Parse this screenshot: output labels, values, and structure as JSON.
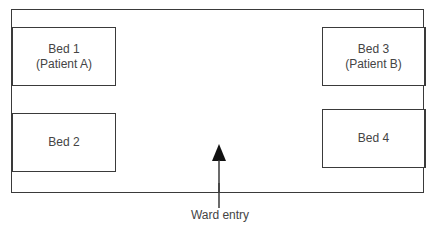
{
  "diagram": {
    "type": "floor-plan",
    "ward": {
      "beds": [
        {
          "id": "bed-1",
          "name": "Bed 1",
          "occupant": "(Patient A)",
          "position": "top-left"
        },
        {
          "id": "bed-2",
          "name": "Bed 2",
          "occupant": "",
          "position": "bottom-left"
        },
        {
          "id": "bed-3",
          "name": "Bed 3",
          "occupant": "(Patient B)",
          "position": "top-right"
        },
        {
          "id": "bed-4",
          "name": "Bed 4",
          "occupant": "",
          "position": "bottom-right"
        }
      ],
      "entry": {
        "label": "Ward entry",
        "arrow_icon": "arrow-up-icon"
      }
    },
    "colors": {
      "line": "#3a3a3a",
      "text": "#444444",
      "background": "#ffffff"
    }
  }
}
